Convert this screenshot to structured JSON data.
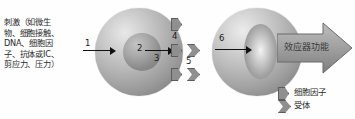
{
  "diagram": {
    "stimulus_text": "刺激（如微生\n物、细胞接触、\nDNA、细胞因\n子、抗体或IC、\n剪应力、压力）",
    "effector_label": "效应器功能",
    "numbers": {
      "n1": "1",
      "n2": "2",
      "n3": "3",
      "n4": "4",
      "n5": "5",
      "n6": "6"
    },
    "legend": [
      {
        "icon": "cytokine-pentagon-icon",
        "label": "细胞因子"
      },
      {
        "icon": "receptor-notched-icon",
        "label": "受体"
      }
    ],
    "colors": {
      "cell_fill_light": "#e8e8e8",
      "cell_fill_dark": "#6f6f6f",
      "nucleus_fill": "#a8a8a8",
      "shape_fill": "#8f8f8f",
      "shape_stroke": "#5c5c5c",
      "arrow_stroke": "#111111",
      "effector_arrow_fill": "#9a9a9a",
      "text_color": "#2b2b2b",
      "background": "#fefefe"
    }
  }
}
